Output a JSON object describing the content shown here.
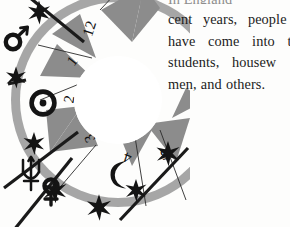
{
  "page": {
    "width": 290,
    "height": 227,
    "background_color": "#fdfdfc"
  },
  "body_text": {
    "lines": [
      {
        "id": "line-0",
        "text": "In England",
        "clipped": true
      },
      {
        "id": "line-1",
        "text": "cent years, people"
      },
      {
        "id": "line-2",
        "text": "have come into t"
      },
      {
        "id": "line-3",
        "text": "students, housew"
      },
      {
        "id": "line-4",
        "text": "men, and others."
      }
    ]
  },
  "wheel": {
    "title": "astrological-chart-wheel",
    "ring_color": "#a6a6a6",
    "wedge_color": "#8c8c8c",
    "ink_color": "#1a1a1a",
    "paper_color": "#ffffff",
    "house_numbers": [
      "12",
      "1",
      "2",
      "3",
      "4",
      "5"
    ],
    "planet_symbols": [
      {
        "name": "mars",
        "glyph": "♂",
        "label": "Mars"
      },
      {
        "name": "sun",
        "glyph": "☉",
        "label": "Sun"
      },
      {
        "name": "neptune",
        "glyph": "♆",
        "label": "Neptune"
      },
      {
        "name": "venus",
        "glyph": "♀",
        "label": "Venus"
      },
      {
        "name": "moon",
        "glyph": "☽",
        "label": "Moon"
      }
    ],
    "cusp_star_count": 7
  }
}
